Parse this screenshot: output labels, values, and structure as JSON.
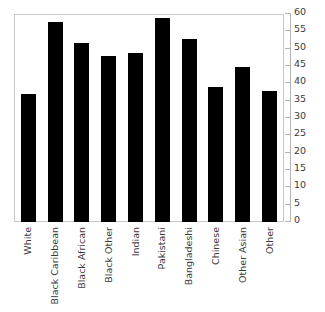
{
  "chart_data": {
    "type": "bar",
    "title": "",
    "xlabel": "",
    "ylabel": "",
    "categories": [
      "White",
      "Black Caribbean",
      "Black African",
      "Black Other",
      "Indian",
      "Pakistani",
      "Bangladeshi",
      "Chinese",
      "Other Asian",
      "Other"
    ],
    "values": [
      37,
      58,
      52,
      48,
      49,
      59,
      53,
      39,
      45,
      38
    ],
    "ylim": [
      0,
      60
    ],
    "yticks": [
      0,
      5,
      10,
      15,
      20,
      25,
      30,
      35,
      40,
      45,
      50,
      55,
      60
    ],
    "ytick_labels": [
      "0",
      "5",
      "10",
      "15",
      "20",
      "25",
      "30",
      "35",
      "40",
      "45",
      "50",
      "55",
      "60"
    ],
    "yaxis_position": "right",
    "grid": false,
    "legend": false,
    "bar_color": "#000000",
    "frame_color": "#c9c9c9",
    "axis_color": "#b4b4b4",
    "text_color": "#3a3a3a"
  },
  "axis": {
    "y_title": "",
    "x_title": ""
  }
}
